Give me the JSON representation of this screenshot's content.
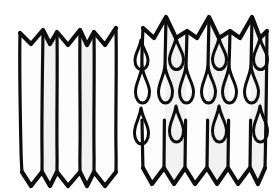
{
  "figure": {
    "title": "Pleated accordion fold diagrams",
    "background_color": "#ffffff",
    "ink_color": "#0d0d0d",
    "panel_fill": "#fdfdfd",
    "panel_shade": "#f2f2f2",
    "canvas": {
      "width": 196,
      "height": 196,
      "units": "px"
    },
    "style": "hand-drawn line art, thick black ink on white, no text labels",
    "panels": [
      {
        "id": "left-figure",
        "name": "plain-pleated-fold",
        "label": "",
        "description": "Accordion-pleated strip with zigzag top edge and pointed bottom edge, six vertical fold lines, no surface motifs",
        "fold_count": 6,
        "motif": "none",
        "motif_rows": 0,
        "motif_count": 0
      },
      {
        "id": "right-figure",
        "name": "teardrop-pleated-fold",
        "label": "",
        "description": "Accordion-pleated strip with zigzag top edge and pointed bottom edge, decorated with rows of outlined teardrop motifs pointing upward at the tip and bulbous at the base",
        "fold_count": 6,
        "motif": "teardrop",
        "motif_rows": 3,
        "motif_count": 11,
        "motif_orientation": "tip-up, bulb-down"
      }
    ],
    "colors": {
      "ink": "#0d0d0d",
      "paper": "#ffffff",
      "face_light": "#fdfdfd",
      "face_shade": "#f2f2f2"
    }
  }
}
